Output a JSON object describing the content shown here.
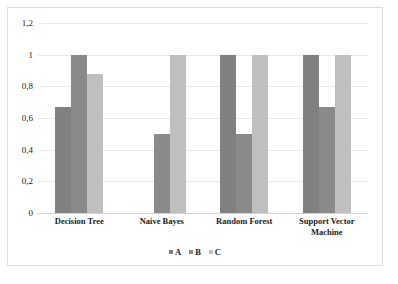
{
  "chart_data": {
    "type": "bar",
    "title": "",
    "subtitle": "",
    "xlabel": "",
    "ylabel": "",
    "categories": [
      "Decision Tree",
      "Naive Bayes",
      "Random Forest",
      "Support Vector Machine"
    ],
    "series": [
      {
        "name": "A",
        "values": [
          0.67,
          0,
          1,
          1
        ],
        "color": "#808080"
      },
      {
        "name": "B",
        "values": [
          1,
          0.5,
          0.5,
          0.67
        ],
        "color": "#8a8a8a"
      },
      {
        "name": "C",
        "values": [
          0.88,
          1,
          1,
          1
        ],
        "color": "#bfbfbf"
      }
    ],
    "ylim": [
      0,
      1.2
    ],
    "ytick_values": [
      0,
      0.2,
      0.4,
      0.6,
      0.8,
      1,
      1.2
    ],
    "ytick_labels": [
      "0",
      "0,2",
      "0,4",
      "0,6",
      "0,8",
      "1",
      "1,2"
    ],
    "grid": true,
    "legend_position": "bottom",
    "legend_entries": [
      "A",
      "B",
      "C"
    ],
    "annotations": []
  }
}
